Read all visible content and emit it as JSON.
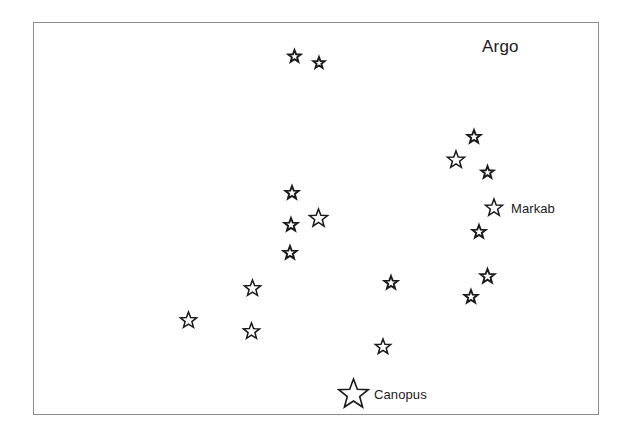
{
  "chart_data": {
    "type": "scatter",
    "title": "Argo",
    "subtitle": "",
    "xlabel": "",
    "ylabel": "",
    "grid": false,
    "legend": "none",
    "xlim": [
      0,
      566
    ],
    "ylim": [
      0,
      393
    ],
    "axis_note": "positions given in pixel coordinates of the framed plot area",
    "series": [
      {
        "name": "stars",
        "points": [
          {
            "id": "star-1",
            "x": 294,
            "y": 56,
            "size": 13,
            "name": ""
          },
          {
            "id": "star-2",
            "x": 319,
            "y": 63,
            "size": 12,
            "name": ""
          },
          {
            "id": "star-3",
            "x": 474,
            "y": 137,
            "size": 14,
            "name": ""
          },
          {
            "id": "star-4",
            "x": 456,
            "y": 160,
            "size": 18,
            "name": ""
          },
          {
            "id": "star-5",
            "x": 487,
            "y": 172,
            "size": 13,
            "name": ""
          },
          {
            "id": "star-6",
            "x": 292,
            "y": 193,
            "size": 14,
            "name": ""
          },
          {
            "id": "star-7",
            "x": 318,
            "y": 218,
            "size": 19,
            "name": ""
          },
          {
            "id": "star-8",
            "x": 291,
            "y": 225,
            "size": 14,
            "name": ""
          },
          {
            "id": "star-9",
            "x": 290,
            "y": 253,
            "size": 14,
            "name": ""
          },
          {
            "id": "star-10",
            "x": 494,
            "y": 208,
            "size": 18,
            "name": "Markab"
          },
          {
            "id": "star-11",
            "x": 479,
            "y": 232,
            "size": 14,
            "name": ""
          },
          {
            "id": "star-12",
            "x": 487,
            "y": 276,
            "size": 15,
            "name": ""
          },
          {
            "id": "star-13",
            "x": 471,
            "y": 297,
            "size": 14,
            "name": ""
          },
          {
            "id": "star-14",
            "x": 391,
            "y": 283,
            "size": 14,
            "name": ""
          },
          {
            "id": "star-15",
            "x": 252,
            "y": 288,
            "size": 17,
            "name": ""
          },
          {
            "id": "star-16",
            "x": 188,
            "y": 320,
            "size": 17,
            "name": ""
          },
          {
            "id": "star-17",
            "x": 251,
            "y": 331,
            "size": 17,
            "name": ""
          },
          {
            "id": "star-18",
            "x": 383,
            "y": 347,
            "size": 16,
            "name": ""
          },
          {
            "id": "star-19",
            "x": 353,
            "y": 394,
            "size": 31,
            "name": "Canopus"
          }
        ]
      }
    ],
    "labels": [
      {
        "id": "label-argo",
        "text": "Argo",
        "x": 482,
        "y": 38
      },
      {
        "id": "label-markab",
        "text": "Markab",
        "x": 511,
        "y": 202
      },
      {
        "id": "label-canopus",
        "text": "Canopus",
        "x": 374,
        "y": 388
      }
    ],
    "colors": {
      "background": "#ffffff",
      "frame": "#8c8c8c",
      "star_outline": "#1a1a1a",
      "star_fill": "#ffffff",
      "text": "#1a1a1a"
    }
  },
  "figure": {
    "constellation_label": "Argo",
    "named_stars": [
      "Markab",
      "Canopus"
    ],
    "star_count": 19
  }
}
